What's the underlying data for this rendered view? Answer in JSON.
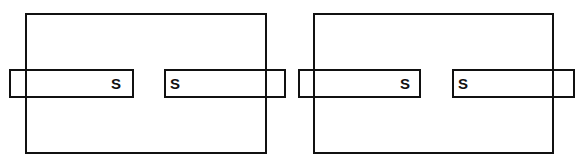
{
  "diagram": {
    "panels": [
      {
        "name": "left-panel",
        "frame": {
          "x": 25,
          "y": 13,
          "w": 242,
          "h": 141
        },
        "magnets": [
          {
            "name": "left-magnet",
            "x": 9,
            "y": 69,
            "w": 125,
            "h": 29,
            "pole_label": "S",
            "label_x": 111,
            "label_y": 76
          },
          {
            "name": "right-magnet",
            "x": 164,
            "y": 69,
            "w": 122,
            "h": 29,
            "pole_label": "S",
            "label_x": 170,
            "label_y": 76
          }
        ]
      },
      {
        "name": "right-panel",
        "frame": {
          "x": 313,
          "y": 13,
          "w": 241,
          "h": 141
        },
        "magnets": [
          {
            "name": "left-magnet",
            "x": 298,
            "y": 69,
            "w": 123,
            "h": 29,
            "pole_label": "S",
            "label_x": 400,
            "label_y": 76
          },
          {
            "name": "right-magnet",
            "x": 452,
            "y": 69,
            "w": 123,
            "h": 29,
            "pole_label": "S",
            "label_x": 458,
            "label_y": 76
          }
        ]
      }
    ],
    "colors": {
      "stroke": "#111111",
      "background": "#ffffff"
    }
  }
}
